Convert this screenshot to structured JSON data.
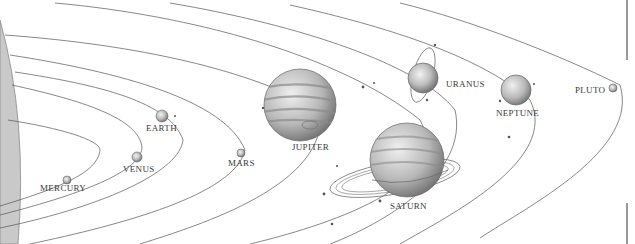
{
  "diagram": {
    "type": "solar-system-orbits",
    "sun": {
      "color": "#c8c8c8"
    },
    "planets": [
      {
        "name": "MERCURY",
        "x": 67,
        "y": 180,
        "r": 4,
        "label_x": 40,
        "label_y": 186
      },
      {
        "name": "VENUS",
        "x": 137,
        "y": 157,
        "r": 5,
        "label_x": 122,
        "label_y": 166
      },
      {
        "name": "EARTH",
        "x": 162,
        "y": 116,
        "r": 6,
        "label_x": 146,
        "label_y": 125
      },
      {
        "name": "MARS",
        "x": 241,
        "y": 153,
        "r": 4,
        "label_x": 228,
        "label_y": 160
      },
      {
        "name": "JUPITER",
        "x": 300,
        "y": 105,
        "r": 36,
        "label_x": 291,
        "label_y": 143
      },
      {
        "name": "SATURN",
        "x": 407,
        "y": 160,
        "r": 37,
        "label_x": 389,
        "label_y": 203
      },
      {
        "name": "URANUS",
        "x": 423,
        "y": 78,
        "r": 15,
        "label_x": 446,
        "label_y": 81
      },
      {
        "name": "NEPTUNE",
        "x": 516,
        "y": 90,
        "r": 15,
        "label_x": 496,
        "label_y": 110
      },
      {
        "name": "PLUTO",
        "x": 613,
        "y": 88,
        "r": 4,
        "label_x": 574,
        "label_y": 85
      }
    ],
    "colors": {
      "orbit": "#555555",
      "planet_fill": "#bdbdbd",
      "planet_stroke": "#6a6a6a",
      "label": "#3a3a3a"
    }
  }
}
